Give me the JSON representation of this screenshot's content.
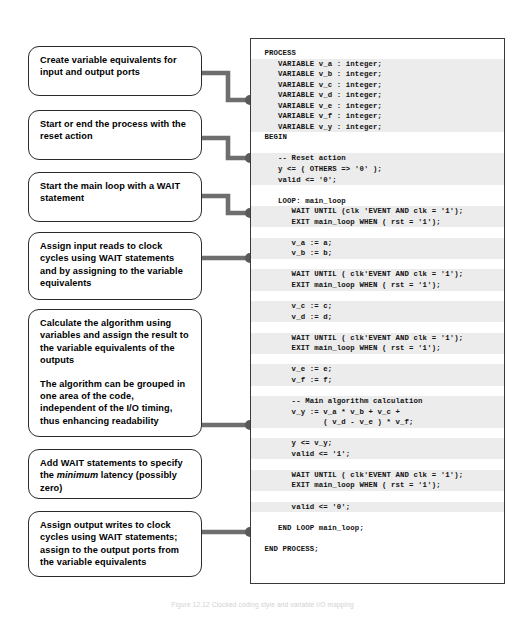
{
  "figure": {
    "caption": "Figure 12.12  Clocked coding style and variable I/O mapping"
  },
  "callouts": [
    {
      "id": "create-variable-equivalents",
      "paragraphs": [
        "Create variable equivalents for input and output ports"
      ]
    },
    {
      "id": "start-or-end-process",
      "paragraphs": [
        "Start or end  the process with the reset action"
      ]
    },
    {
      "id": "start-main-loop",
      "paragraphs": [
        "Start the main loop with a WAIT statement"
      ]
    },
    {
      "id": "assign-input-reads",
      "paragraphs": [
        "Assign input reads to clock cycles using WAIT statements and by assigning to the variable equivalents"
      ]
    },
    {
      "id": "calculate-algorithm",
      "paragraphs": [
        "Calculate the algorithm using variables and assign the result to the variable equivalents of the outputs",
        "The algorithm can be grouped in one area of the code, independent of the I/O timing, thus enhancing readability"
      ]
    },
    {
      "id": "add-wait-statements",
      "paragraphs_html": [
        "Add WAIT statements to specify the <em>minimum</em> latency (possibly zero)"
      ]
    },
    {
      "id": "assign-output-writes",
      "paragraphs": [
        "Assign output writes to clock cycles using WAIT statements; assign to the output ports from the variable equivalents"
      ]
    }
  ],
  "code": {
    "language": "VHDL",
    "lines": [
      {
        "text": " PROCESS",
        "highlight": false
      },
      {
        "text": "    VARIABLE v_a : integer;",
        "highlight": true
      },
      {
        "text": "    VARIABLE v_b : integer;",
        "highlight": true
      },
      {
        "text": "    VARIABLE v_c : integer;",
        "highlight": true
      },
      {
        "text": "    VARIABLE v_d : integer;",
        "highlight": true
      },
      {
        "text": "    VARIABLE v_e : integer;",
        "highlight": true
      },
      {
        "text": "    VARIABLE v_f : integer;",
        "highlight": true
      },
      {
        "text": "    VARIABLE v_y : integer;",
        "highlight": true
      },
      {
        "text": " BEGIN",
        "highlight": false
      },
      {
        "text": "",
        "highlight": false
      },
      {
        "text": "    -- Reset action",
        "highlight": true
      },
      {
        "text": "    y <= ( OTHERS => '0' );",
        "highlight": true
      },
      {
        "text": "    valid <= '0';",
        "highlight": true
      },
      {
        "text": "",
        "highlight": false
      },
      {
        "text": "    LOOP: main_loop",
        "highlight": false
      },
      {
        "text": "       WAIT UNTIL (clk 'EVENT AND clk = '1');",
        "highlight": true
      },
      {
        "text": "       EXIT main_loop WHEN ( rst = '1');",
        "highlight": true
      },
      {
        "text": "",
        "highlight": false
      },
      {
        "text": "       v_a := a;",
        "highlight": true
      },
      {
        "text": "       v_b := b;",
        "highlight": true
      },
      {
        "text": "",
        "highlight": false
      },
      {
        "text": "       WAIT UNTIL ( clk'EVENT AND clk = '1');",
        "highlight": true
      },
      {
        "text": "       EXIT main_loop WHEN ( rst = '1');",
        "highlight": true
      },
      {
        "text": "",
        "highlight": false
      },
      {
        "text": "       v_c := c;",
        "highlight": true
      },
      {
        "text": "       v_d := d;",
        "highlight": true
      },
      {
        "text": "",
        "highlight": false
      },
      {
        "text": "       WAIT UNTIL ( clk'EVENT AND clk = '1');",
        "highlight": true
      },
      {
        "text": "       EXIT main_loop WHEN ( rst = '1');",
        "highlight": true
      },
      {
        "text": "",
        "highlight": false
      },
      {
        "text": "       v_e := e;",
        "highlight": true
      },
      {
        "text": "       v_f := f;",
        "highlight": true
      },
      {
        "text": "",
        "highlight": false
      },
      {
        "text": "       -- Main algorithm calculation",
        "highlight": true
      },
      {
        "text": "       v_y := v_a * v_b + v_c +",
        "highlight": true
      },
      {
        "text": "              ( v_d - v_e ) * v_f;",
        "highlight": true
      },
      {
        "text": "",
        "highlight": false
      },
      {
        "text": "       y <= v_y;",
        "highlight": true
      },
      {
        "text": "       valid <= '1';",
        "highlight": true
      },
      {
        "text": "",
        "highlight": false
      },
      {
        "text": "       WAIT UNTIL ( clk'EVENT AND clk = '1');",
        "highlight": true
      },
      {
        "text": "       EXIT main_loop WHEN ( rst = '1');",
        "highlight": true
      },
      {
        "text": "",
        "highlight": false
      },
      {
        "text": "       valid <= '0';",
        "highlight": true
      },
      {
        "text": "",
        "highlight": false
      },
      {
        "text": "    END LOOP main_loop;",
        "highlight": false
      },
      {
        "text": "",
        "highlight": false
      },
      {
        "text": " END PROCESS;",
        "highlight": false
      }
    ]
  },
  "connectors": {
    "color": "#6e6e6e",
    "dot_color": "#5a5a5a",
    "items": [
      {
        "id": "connector-create-variable-equivalents",
        "box_y": 73,
        "dot_y": 100
      },
      {
        "id": "connector-start-or-end-process",
        "box_y": 138,
        "dot_y": 158
      },
      {
        "id": "connector-start-main-loop",
        "box_y": 196,
        "dot_y": 213
      },
      {
        "id": "connector-assign-input-reads",
        "box_y": 258,
        "dot_y": 258
      },
      {
        "id": "connector-calculate-algorithm",
        "box_y": 425,
        "dot_y": 425
      },
      {
        "id": "connector-assign-output-writes",
        "box_y": 532,
        "dot_y": 532
      }
    ]
  }
}
